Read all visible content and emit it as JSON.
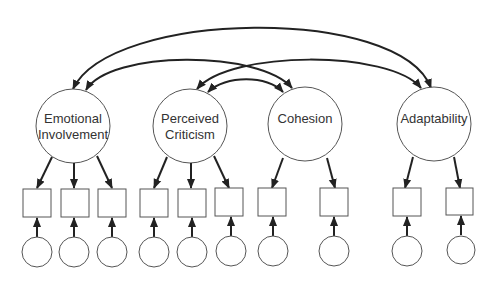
{
  "diagram": {
    "type": "structural-equation-model",
    "latent_factors": [
      {
        "id": "ei",
        "label_lines": [
          "Emotional",
          "Involvement"
        ],
        "indicators": 3
      },
      {
        "id": "pc",
        "label_lines": [
          "Perceived",
          "Criticism"
        ],
        "indicators": 3
      },
      {
        "id": "coh",
        "label_lines": [
          "Cohesion"
        ],
        "indicators": 2
      },
      {
        "id": "adapt",
        "label_lines": [
          "Adaptability"
        ],
        "indicators": 2
      }
    ],
    "covariances": [
      {
        "from": "Emotional Involvement",
        "to": "Adaptability"
      },
      {
        "from": "Emotional Involvement",
        "to": "Cohesion"
      },
      {
        "from": "Perceived Criticism",
        "to": "Adaptability"
      },
      {
        "from": "Perceived Criticism",
        "to": "Cohesion"
      }
    ],
    "colors": {
      "stroke": "#555555",
      "arrow": "#222222",
      "text": "#333333",
      "background": "#ffffff"
    }
  }
}
